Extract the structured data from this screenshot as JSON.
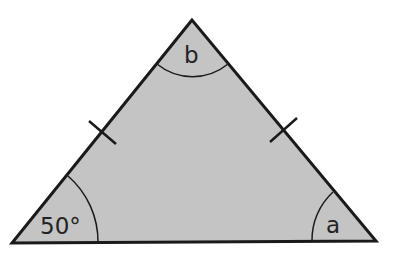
{
  "diagram": {
    "type": "isosceles-triangle",
    "fill_color": "#c4c4c4",
    "stroke_color": "#1a1a1a",
    "vertices": {
      "top": [
        192,
        20
      ],
      "bottom_left": [
        12,
        243
      ],
      "bottom_right": [
        376,
        241
      ]
    },
    "angles": {
      "bottom_left": "50°",
      "top": "b",
      "bottom_right": "a"
    },
    "equal_sides_marked": [
      "left",
      "right"
    ]
  }
}
